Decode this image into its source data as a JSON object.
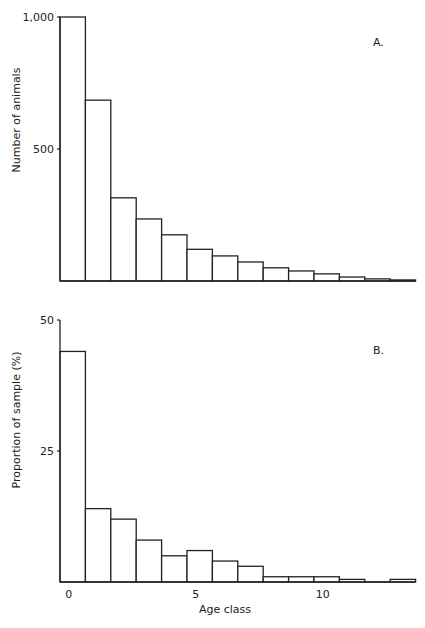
{
  "chart_data": [
    {
      "type": "bar",
      "panel_label": "A.",
      "title": "",
      "xlabel": "",
      "ylabel": "Number of animals",
      "ylim": [
        0,
        1000
      ],
      "yticks": [
        "1,000",
        "500"
      ],
      "categories": [
        0,
        1,
        2,
        3,
        4,
        5,
        6,
        7,
        8,
        9,
        10,
        11,
        12,
        13
      ],
      "values": [
        1000,
        685,
        315,
        235,
        175,
        120,
        95,
        72,
        50,
        38,
        27,
        15,
        8,
        4
      ],
      "grid": false,
      "legend": null
    },
    {
      "type": "bar",
      "panel_label": "B.",
      "title": "",
      "xlabel": "Age class",
      "ylabel": "Proportion of sample (%)",
      "ylim": [
        0,
        50
      ],
      "yticks": [
        "50",
        "25"
      ],
      "xticks": [
        "0",
        "5",
        "10"
      ],
      "categories": [
        0,
        1,
        2,
        3,
        4,
        5,
        6,
        7,
        8,
        9,
        10,
        11,
        12,
        13
      ],
      "values": [
        44,
        14,
        12,
        8,
        5,
        6,
        4,
        3,
        1,
        1,
        1,
        0.5,
        0,
        0.5
      ],
      "grid": false,
      "legend": null
    }
  ]
}
